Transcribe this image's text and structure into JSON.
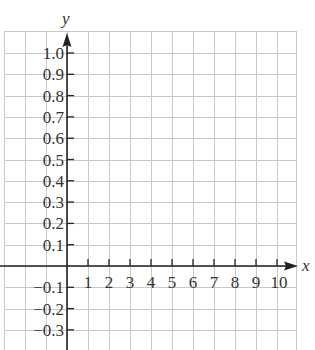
{
  "chart_data": {
    "type": "line",
    "title": "",
    "xlabel": "x",
    "ylabel": "y",
    "xlim": [
      -3,
      11
    ],
    "ylim": [
      -0.4,
      1.1
    ],
    "grid": true,
    "x_ticks": [
      1,
      2,
      3,
      4,
      5,
      6,
      7,
      8,
      9,
      10
    ],
    "x_tick_labels": [
      "1",
      "2",
      "3",
      "4",
      "5",
      "6",
      "7",
      "8",
      "9",
      "10"
    ],
    "y_ticks": [
      1.0,
      0.9,
      0.8,
      0.7,
      0.6,
      0.5,
      0.4,
      0.3,
      0.2,
      0.1,
      -0.1,
      -0.2,
      -0.3
    ],
    "y_tick_labels": [
      "1.0",
      "0.9",
      "0.8",
      "0.7",
      "0.6",
      "0.5",
      "0.4",
      "0.3",
      "0.2",
      "0.1",
      "−0.1",
      "−0.2",
      "−0.3"
    ],
    "series": [],
    "legend": null
  },
  "colors": {
    "grid": "#c8c8c8",
    "axis": "#222222",
    "text": "#333333"
  }
}
